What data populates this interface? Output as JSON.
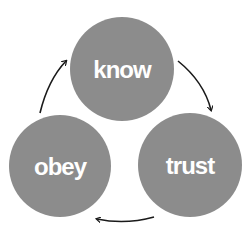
{
  "diagram": {
    "type": "cycle",
    "colors": {
      "node_fill": "#8c8c8c",
      "node_text": "#ffffff",
      "arrow": "#1a1a1a",
      "background": "#ffffff"
    },
    "nodes": [
      {
        "id": "know",
        "label": "know",
        "cx": 122,
        "cy": 69,
        "r": 52
      },
      {
        "id": "trust",
        "label": "trust",
        "cx": 190,
        "cy": 165,
        "r": 52
      },
      {
        "id": "obey",
        "label": "obey",
        "cx": 60,
        "cy": 166,
        "r": 51
      }
    ],
    "edges": [
      {
        "from": "know",
        "to": "trust"
      },
      {
        "from": "trust",
        "to": "obey"
      },
      {
        "from": "obey",
        "to": "know"
      }
    ]
  }
}
